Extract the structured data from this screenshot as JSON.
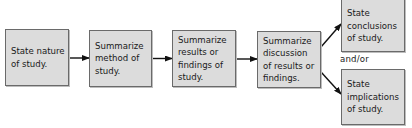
{
  "diagram": {
    "type": "flowchart",
    "direction": "left-to-right",
    "colors": {
      "box_fill": "#dcdcdc",
      "box_border": "#6a6a6a",
      "arrow": "#111111",
      "text": "#1a1a1a"
    },
    "nodes": [
      {
        "id": "n1",
        "label": "State nature\nof study."
      },
      {
        "id": "n2",
        "label": "Summarize\nmethod of\nstudy."
      },
      {
        "id": "n3",
        "label": "Summarize\nresults or\nfindings of\nstudy."
      },
      {
        "id": "n4",
        "label": "Summarize\ndiscussion\nof results or\nfindings."
      },
      {
        "id": "n5",
        "label": "State\nconclusions\nof study."
      },
      {
        "id": "n6",
        "label": "State\nimplications\nof study."
      }
    ],
    "edges": [
      {
        "from": "n1",
        "to": "n2"
      },
      {
        "from": "n2",
        "to": "n3"
      },
      {
        "from": "n3",
        "to": "n4"
      },
      {
        "from": "n4",
        "to": "n5"
      },
      {
        "from": "n4",
        "to": "n6"
      }
    ],
    "branch_label": "and/or"
  }
}
